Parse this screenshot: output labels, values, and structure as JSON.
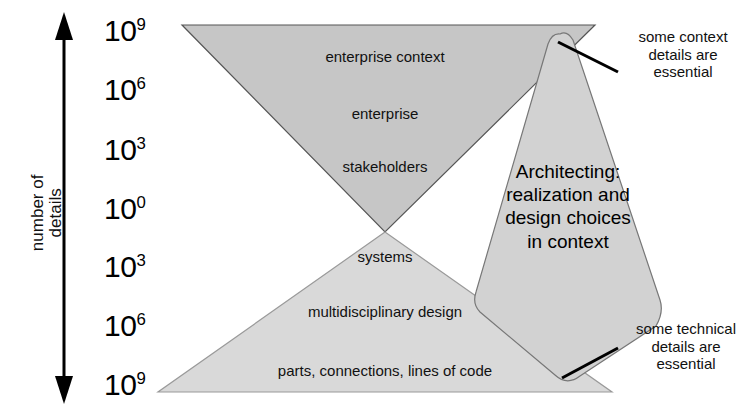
{
  "figure": {
    "axis": {
      "caption": "number of\ndetails",
      "arrow_name": "double-headed-vertical-arrow",
      "ticks": [
        {
          "base": "10",
          "exp": "9"
        },
        {
          "base": "10",
          "exp": "6"
        },
        {
          "base": "10",
          "exp": "3"
        },
        {
          "base": "10",
          "exp": "0"
        },
        {
          "base": "10",
          "exp": "3"
        },
        {
          "base": "10",
          "exp": "6"
        },
        {
          "base": "10",
          "exp": "9"
        }
      ]
    },
    "upper_triangle": {
      "name": "context-triangle",
      "fill": "#c6c6c6",
      "stroke": "#555555",
      "labels": [
        "enterprise context",
        "enterprise",
        "stakeholders"
      ]
    },
    "lower_triangle": {
      "name": "technical-triangle",
      "fill": "#d9d9d9",
      "stroke": "#888888",
      "labels": [
        "systems",
        "multidisciplinary design",
        "parts, connections, lines of code"
      ]
    },
    "diamond": {
      "name": "architecting-diamond",
      "fill": "#d2d2d2",
      "stroke": "#777777",
      "text": "Architecting:\nrealization and\ndesign choices\nin context"
    },
    "callouts": [
      {
        "name": "context-callout",
        "text": "some context\ndetails are\nessential"
      },
      {
        "name": "technical-callout",
        "text": "some technical\ndetails are\nessential"
      }
    ]
  }
}
